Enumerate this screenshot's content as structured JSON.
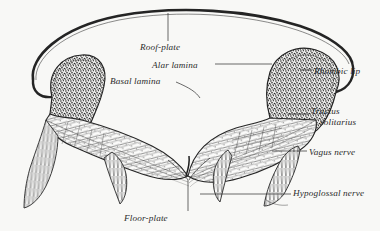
{
  "figure": {
    "kind": "anatomical-engraving",
    "background_color": "#f8f8f6",
    "ink_color": "#2b2b2b"
  },
  "labels": {
    "roof_plate": "Roof-plate",
    "alar_lamina": "Alar lamina",
    "basal_lamina": "Basal lamina",
    "rhombic_lip": "Rhombic lip",
    "tractus_line1": "Tractus",
    "tractus_line2": "solitarius",
    "vagus_nerve": "Vagus nerve",
    "hypoglossal_nerve": "Hypoglossal nerve",
    "floor_plate": "Floor-plate"
  }
}
